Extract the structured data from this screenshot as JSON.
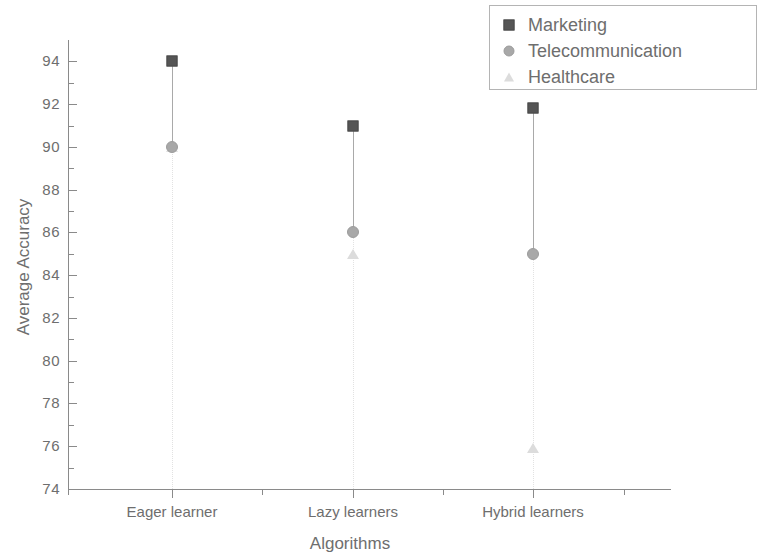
{
  "chart_data": {
    "type": "scatter",
    "title": "",
    "xlabel": "Algorithms",
    "ylabel": "Average Accuracy",
    "categories": [
      "Eager learner",
      "Lazy learners",
      "Hybrid learners"
    ],
    "series": [
      {
        "name": "Marketing",
        "marker": "square",
        "color": "#555555",
        "values": [
          94,
          91,
          91.8
        ]
      },
      {
        "name": "Telecommunication",
        "marker": "circle",
        "color": "#a8a8a8",
        "values": [
          90,
          86,
          85
        ]
      },
      {
        "name": "Healthcare",
        "marker": "triangle",
        "color": "#dcdcdc",
        "values": [
          90,
          85,
          75.9
        ]
      }
    ],
    "ylim": [
      74,
      95
    ],
    "ytick_labels": [
      "94",
      "92",
      "90",
      "88",
      "86",
      "84",
      "82",
      "80",
      "78",
      "76",
      "74"
    ],
    "ytick_values": [
      94,
      92,
      90,
      88,
      86,
      84,
      82,
      80,
      78,
      76,
      74
    ],
    "ytick_minor_step": 1,
    "grid": false,
    "legend_position": "top-right",
    "drop_lines": true
  },
  "legend": {
    "entries": [
      {
        "label": "Marketing",
        "icon": "square-marker-icon"
      },
      {
        "label": "Telecommunication",
        "icon": "circle-marker-icon"
      },
      {
        "label": "Healthcare",
        "icon": "triangle-marker-icon"
      }
    ]
  }
}
